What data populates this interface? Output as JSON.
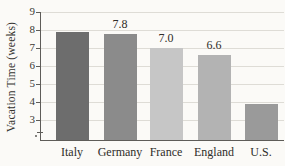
{
  "chart_data": {
    "type": "bar",
    "title": "",
    "xlabel": "",
    "ylabel": "Vacation Time (weeks)",
    "categories": [
      "Italy",
      "Germany",
      "France",
      "England",
      "U.S."
    ],
    "values": [
      7.9,
      7.8,
      7.0,
      6.6,
      3.9
    ],
    "value_labels": [
      null,
      "7.8",
      "7.0",
      "6.6",
      null
    ],
    "bar_colors": [
      "#6d6d6d",
      "#8b8b8b",
      "#c6c6c6",
      "#b3b3b3",
      "#9a9a9a"
    ],
    "yticks": [
      3,
      4,
      5,
      6,
      7,
      8,
      9
    ],
    "ylim": [
      1.89,
      9
    ],
    "axis_break_at_bottom": true,
    "grid": true,
    "legend": "none",
    "colors": {
      "background": "#fbfaf7",
      "axis": "#5e5c58",
      "gridline": "#dedcd6",
      "text": "#2f2d29"
    }
  }
}
